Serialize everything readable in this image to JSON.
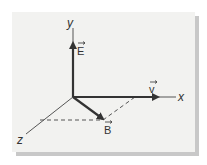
{
  "diagram": {
    "axes": {
      "x_label": "x",
      "y_label": "y",
      "z_label": "z"
    },
    "vectors": [
      {
        "name": "E",
        "label": "E",
        "direction": "+y"
      },
      {
        "name": "v",
        "label": "v",
        "direction": "+x"
      },
      {
        "name": "B",
        "label": "B",
        "direction": "in x-z plane"
      }
    ],
    "colors": {
      "background": "#f2f2f0",
      "shadow": "#c8c8c8",
      "ink": "#333333"
    }
  }
}
